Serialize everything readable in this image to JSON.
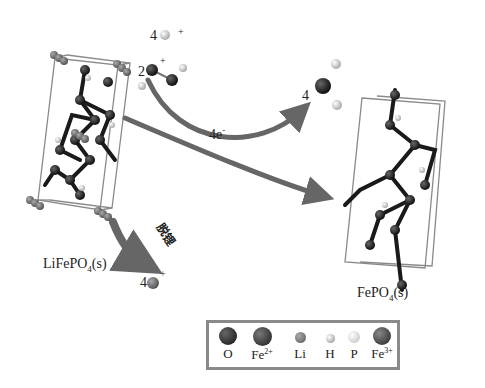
{
  "labels": {
    "reactant": "LiFePO",
    "reactant_sub": "4",
    "reactant_state": "(s)",
    "product": "FePO",
    "product_sub": "4",
    "product_state": "(s)",
    "delithiation": "脱锂",
    "electrons": "4e",
    "electrons_sup": "-",
    "h_ion_coef": "4",
    "h_ion_charge": "+",
    "h2o2_coef": "2",
    "h2o2_charge": "+",
    "water_coef": "4",
    "li_ion_coef": "4",
    "li_ion_charge": "+"
  },
  "legend": {
    "items": [
      {
        "label": "O",
        "sup": "",
        "color": "#1a1a1a",
        "size": 18
      },
      {
        "label": "Fe",
        "sup": "2+",
        "color": "#2a2a2a",
        "size": 19
      },
      {
        "label": "Li",
        "sup": "",
        "color": "#666666",
        "size": 11
      },
      {
        "label": "H",
        "sup": "",
        "color": "#cfcfcf",
        "size": 9
      },
      {
        "label": "P",
        "sup": "",
        "color": "#dddddd",
        "size": 12
      },
      {
        "label": "Fe",
        "sup": "3+",
        "color": "#333333",
        "size": 18
      }
    ]
  },
  "colors": {
    "arrow": "#666666",
    "cell_edge": "#8a8a8a",
    "atom_dark": "#1a1a1a",
    "atom_li": "#777777"
  }
}
